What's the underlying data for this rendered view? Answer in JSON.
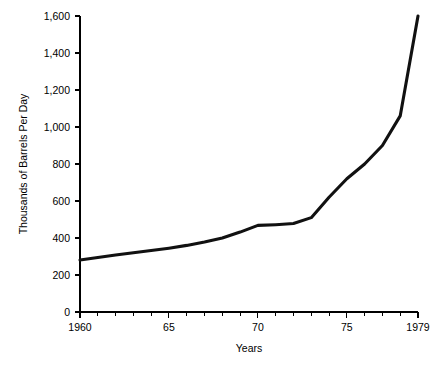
{
  "chart_data": {
    "type": "line",
    "title": "",
    "xlabel": "Years",
    "ylabel": "Thousands of Barrels Per Day",
    "xlim": [
      1960,
      1979
    ],
    "ylim": [
      0,
      1600
    ],
    "grid": false,
    "legend": null,
    "x": [
      1960,
      1961,
      1962,
      1963,
      1964,
      1965,
      1966,
      1967,
      1968,
      1969,
      1970,
      1971,
      1972,
      1973,
      1974,
      1975,
      1976,
      1977,
      1978,
      1979
    ],
    "values": [
      281,
      295,
      308,
      320,
      332,
      345,
      360,
      378,
      400,
      432,
      468,
      472,
      478,
      510,
      620,
      720,
      800,
      900,
      1060,
      1600
    ],
    "series": [
      {
        "name": "Thousands of Barrels Per Day",
        "values": [
          281,
          295,
          308,
          320,
          332,
          345,
          360,
          378,
          400,
          432,
          468,
          472,
          478,
          510,
          620,
          720,
          800,
          900,
          1060,
          1600
        ]
      }
    ],
    "y_ticks": [
      0,
      200,
      400,
      600,
      800,
      1000,
      1200,
      1400,
      1600
    ],
    "y_tick_labels": [
      "0",
      "200",
      "400",
      "600",
      "800",
      "1,000",
      "1,200",
      "1,400",
      "1,600"
    ],
    "x_ticks": [
      1960,
      1965,
      1970,
      1975,
      1979
    ],
    "x_tick_labels": [
      "1960",
      "65",
      "70",
      "75",
      "1979"
    ],
    "x_minor_ticks": [
      1961,
      1962,
      1963,
      1964,
      1966,
      1967,
      1968,
      1969,
      1971,
      1972,
      1973,
      1974,
      1976,
      1977,
      1978
    ],
    "line_color": "#111111"
  },
  "axis": {
    "y_label": "Thousands of Barrels Per Day",
    "x_label": "Years"
  },
  "header": {
    "cropped_title": ""
  }
}
